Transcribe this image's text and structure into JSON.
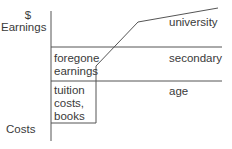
{
  "diagram": {
    "y_axis": {
      "top_symbol": "$",
      "top_label": "Earnings",
      "bottom_label": "Costs"
    },
    "x_axis": {
      "label": "age"
    },
    "curves": {
      "university": "university",
      "secondary": "secondary"
    },
    "regions": {
      "foregone": [
        "foregone",
        "earnings"
      ],
      "tuition": [
        "tuition",
        "costs,",
        "books"
      ]
    },
    "colors": {
      "line": "#444444",
      "text": "#3a3a3a",
      "background": "#ffffff"
    }
  }
}
